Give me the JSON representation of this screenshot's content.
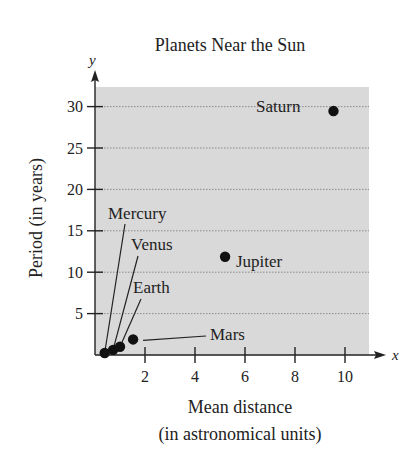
{
  "chart_data": {
    "type": "scatter",
    "title": "Planets Near the Sun",
    "xlabel": "Mean distance",
    "xlabel_sub": "(in astronomical units)",
    "ylabel": "Period (in years)",
    "x_axis_letter": "x",
    "y_axis_letter": "y",
    "xlim": [
      0,
      11
    ],
    "ylim": [
      0,
      32
    ],
    "x_ticks": [
      2,
      4,
      6,
      8,
      10
    ],
    "y_ticks": [
      5,
      10,
      15,
      20,
      25,
      30
    ],
    "grid": "horizontal dotted",
    "plot_background": "#d9d9d9",
    "point_color": "#111111",
    "points": [
      {
        "name": "Mercury",
        "x": 0.387,
        "y": 0.241
      },
      {
        "name": "Venus",
        "x": 0.723,
        "y": 0.615
      },
      {
        "name": "Earth",
        "x": 1.0,
        "y": 1.0
      },
      {
        "name": "Mars",
        "x": 1.524,
        "y": 1.881
      },
      {
        "name": "Jupiter",
        "x": 5.203,
        "y": 11.86
      },
      {
        "name": "Saturn",
        "x": 9.539,
        "y": 29.46
      }
    ]
  }
}
